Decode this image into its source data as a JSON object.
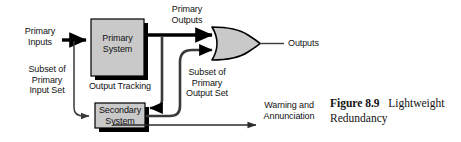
{
  "figure": {
    "canvas": {
      "width": 461,
      "height": 142,
      "background": "#ffffff"
    },
    "caption": {
      "number": "Figure 8.9",
      "text": "Lightweight Redundancy"
    }
  },
  "blocks": [
    {
      "id": "primary-system",
      "label": "Primary\nSystem",
      "x": 91,
      "y": 19,
      "w": 53,
      "h": 57,
      "fill": "#c9c9c9",
      "stroke": "#000000",
      "shadow": "#000000"
    },
    {
      "id": "secondary-system",
      "label": "Secondary\nSystem",
      "x": 95,
      "y": 103,
      "w": 50,
      "h": 25,
      "fill": "#c9c9c9",
      "stroke": "#000000",
      "shadow": "#000000"
    }
  ],
  "gate": {
    "id": "or-gate",
    "type": "OR",
    "x": 210,
    "y": 27,
    "w": 50,
    "h": 33,
    "fill": "#c9c9c9",
    "stroke": "#000000"
  },
  "labels": [
    {
      "id": "primary-inputs",
      "text": "Primary\nInputs",
      "x": 14,
      "y": 26,
      "w": 52
    },
    {
      "id": "primary-outputs",
      "text": "Primary\nOutputs",
      "x": 160,
      "y": 4,
      "w": 54
    },
    {
      "id": "outputs",
      "text": "Outputs",
      "x": 262,
      "y": 36,
      "w": 42
    },
    {
      "id": "subset-input-set",
      "text": "Subset of\nPrimary\nInput Set",
      "x": 18,
      "y": 64,
      "w": 58
    },
    {
      "id": "output-tracking",
      "text": "Output Tracking",
      "x": 79,
      "y": 81,
      "w": 82
    },
    {
      "id": "subset-output-set",
      "text": "Subset of\nPrimary\nOutput Set",
      "x": 178,
      "y": 67,
      "w": 58
    },
    {
      "id": "warning-annunciation",
      "text": "Warning and\nAnnunciation",
      "x": 256,
      "y": 100,
      "w": 62
    }
  ],
  "connections": [
    {
      "id": "primary-inputs-to-primary-system",
      "style": "thick-arrow"
    },
    {
      "id": "primary-inputs-branch-to-secondary-system",
      "style": "thin-arrow"
    },
    {
      "id": "primary-system-to-or-gate",
      "style": "thick-arrow"
    },
    {
      "id": "primary-output-tracking-to-secondary-system",
      "style": "thick-arrow"
    },
    {
      "id": "secondary-system-to-or-gate",
      "style": "thick-arrow"
    },
    {
      "id": "or-gate-to-outputs",
      "style": "thin-line"
    },
    {
      "id": "secondary-system-to-warning",
      "style": "thin-arrow"
    }
  ],
  "colors": {
    "line": "#3a3a3a",
    "line_dark": "#000000",
    "box_fill": "#c9c9c9",
    "text": "#111111",
    "background": "#ffffff"
  }
}
